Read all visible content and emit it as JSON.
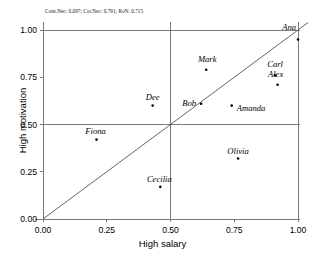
{
  "chart_data": {
    "type": "scatter",
    "title": "Cons.Nec: 0.097; Cor.Nec: 0.791; RoN: 0.715",
    "xlabel": "High salary",
    "ylabel": "High motivation",
    "xlim": [
      0.0,
      1.0
    ],
    "ylim": [
      0.0,
      1.0
    ],
    "xticks": [
      "0.00",
      "0.25",
      "0.50",
      "0.75",
      "1.00"
    ],
    "xtick_values": [
      0.0,
      0.25,
      0.5,
      0.75,
      1.0
    ],
    "yticks": [
      "0.00",
      "0.25",
      "0.50",
      "0.75",
      "1.00"
    ],
    "ytick_values": [
      0.0,
      0.25,
      0.5,
      0.75,
      1.0
    ],
    "grid": "crosshair at 0.50 and bounding lines at 1.00",
    "gridlines_h": [
      0.5,
      1.0
    ],
    "gridlines_v": [
      0.5,
      1.0
    ],
    "diagonal_line": "y = x from (0,0) to (1,1)",
    "legend": "none",
    "points": [
      {
        "label": "Ana",
        "x": 1.0,
        "y": 0.95,
        "label_dx": -2,
        "label_dy": -11,
        "label_anchor": "end"
      },
      {
        "label": "Carl",
        "x": 0.91,
        "y": 0.76,
        "label_dx": 0,
        "label_dy": -10,
        "label_anchor": "middle"
      },
      {
        "label": "Alex",
        "x": 0.92,
        "y": 0.71,
        "label_dx": -2,
        "label_dy": -10,
        "label_anchor": "middle"
      },
      {
        "label": "Mark",
        "x": 0.64,
        "y": 0.79,
        "label_dx": 1,
        "label_dy": -10,
        "label_anchor": "middle"
      },
      {
        "label": "Amanda",
        "x": 0.74,
        "y": 0.6,
        "label_dx": 5,
        "label_dy": 3,
        "label_anchor": "start"
      },
      {
        "label": "Bob",
        "x": 0.62,
        "y": 0.61,
        "label_dx": -5,
        "label_dy": 0,
        "label_anchor": "end"
      },
      {
        "label": "Dee",
        "x": 0.43,
        "y": 0.6,
        "label_dx": 0,
        "label_dy": -8,
        "label_anchor": "middle"
      },
      {
        "label": "Fiona",
        "x": 0.21,
        "y": 0.42,
        "label_dx": -1,
        "label_dy": -8,
        "label_anchor": "middle"
      },
      {
        "label": "Olivia",
        "x": 0.765,
        "y": 0.32,
        "label_dx": 0,
        "label_dy": -7,
        "label_anchor": "middle"
      },
      {
        "label": "Cecilia",
        "x": 0.46,
        "y": 0.17,
        "label_dx": -1,
        "label_dy": -7,
        "label_anchor": "middle"
      }
    ],
    "colors": {
      "background": "#ffffff",
      "axis": "#7a7a7a",
      "gridline": "#7a7a7a",
      "diagonal": "#555555",
      "marker": "#000000",
      "text": "#000000"
    }
  }
}
